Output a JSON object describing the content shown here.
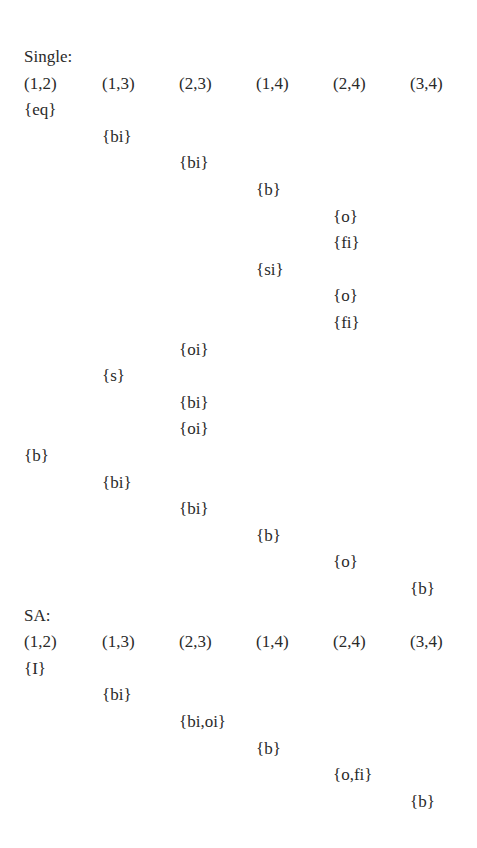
{
  "layout": {
    "origin_x": 24,
    "col_pitch": 77,
    "first_baseline_y": 62,
    "row_pitch": 26.6
  },
  "sections": [
    {
      "title": "Single:",
      "headers": [
        "(1,2)",
        "(1,3)",
        "(2,3)",
        "(1,4)",
        "(2,4)",
        "(3,4)"
      ],
      "rows": [
        {
          "col": 0,
          "text": "{eq}"
        },
        {
          "col": 1,
          "text": "{bi}"
        },
        {
          "col": 2,
          "text": "{bi}"
        },
        {
          "col": 3,
          "text": "{b}"
        },
        {
          "col": 4,
          "text": "{o}"
        },
        {
          "col": 4,
          "text": "{fi}"
        },
        {
          "col": 3,
          "text": "{si}"
        },
        {
          "col": 4,
          "text": "{o}"
        },
        {
          "col": 4,
          "text": "{fi}"
        },
        {
          "col": 2,
          "text": "{oi}"
        },
        {
          "col": 1,
          "text": "{s}"
        },
        {
          "col": 2,
          "text": "{bi}"
        },
        {
          "col": 2,
          "text": "{oi}"
        },
        {
          "col": 0,
          "text": "{b}"
        },
        {
          "col": 1,
          "text": "{bi}"
        },
        {
          "col": 2,
          "text": "{bi}"
        },
        {
          "col": 3,
          "text": "{b}"
        },
        {
          "col": 4,
          "text": "{o}"
        },
        {
          "col": 5,
          "text": "{b}"
        }
      ]
    },
    {
      "title": "SA:",
      "headers": [
        "(1,2)",
        "(1,3)",
        "(2,3)",
        "(1,4)",
        "(2,4)",
        "(3,4)"
      ],
      "rows": [
        {
          "col": 0,
          "text": "{I}"
        },
        {
          "col": 1,
          "text": "{bi}"
        },
        {
          "col": 2,
          "text": "{bi,oi}"
        },
        {
          "col": 3,
          "text": "{b}"
        },
        {
          "col": 4,
          "text": "{o,fi}"
        },
        {
          "col": 5,
          "text": "{b}"
        }
      ]
    }
  ]
}
